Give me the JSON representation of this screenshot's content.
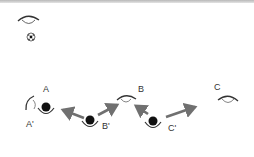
{
  "diagram": {
    "type": "eye-ball-vision-diagram",
    "labels": {
      "A": "A",
      "A_prime": "A'",
      "B": "B",
      "B_prime": "B'",
      "C": "C",
      "C_prime": "C'"
    },
    "legend": {
      "eye_icon": "eye",
      "ball_icon": "soccer-ball"
    },
    "colors": {
      "arrow": "#707070",
      "ball": "#111111",
      "line": "#333333",
      "top_bar": "#c0c0c0"
    }
  }
}
